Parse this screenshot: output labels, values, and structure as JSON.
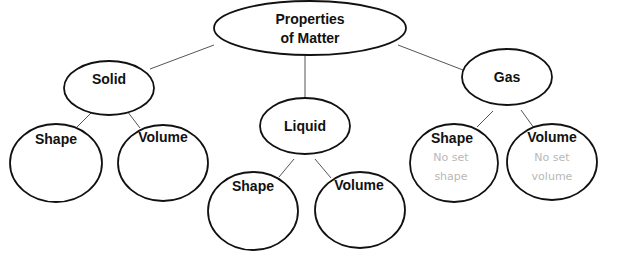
{
  "diagram": {
    "type": "concept-map",
    "root": {
      "label_line1": "Properties",
      "label_line2": "of Matter"
    },
    "solid": {
      "label": "Solid",
      "shape": {
        "label": "Shape",
        "note_line1": "",
        "note_line2": ""
      },
      "volume": {
        "label": "Volume",
        "note_line1": "",
        "note_line2": ""
      }
    },
    "liquid": {
      "label": "Liquid",
      "shape": {
        "label": "Shape",
        "note_line1": "",
        "note_line2": ""
      },
      "volume": {
        "label": "Volume",
        "note_line1": "",
        "note_line2": ""
      }
    },
    "gas": {
      "label": "Gas",
      "shape": {
        "label": "Shape",
        "note_line1": "No set",
        "note_line2": "shape"
      },
      "volume": {
        "label": "Volume",
        "note_line1": "No set",
        "note_line2": "volume"
      }
    },
    "colors": {
      "stroke": "#111111",
      "connector": "#555555",
      "note_text": "#b8b8b8",
      "background": "#ffffff"
    }
  }
}
